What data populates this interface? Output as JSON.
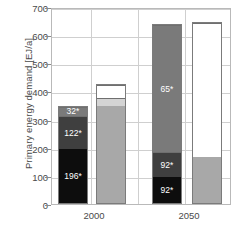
{
  "chart_data": {
    "type": "bar",
    "title": "",
    "xlabel": "",
    "ylabel": "Primary energy demand [EJ/a]",
    "ylim": [
      0,
      700
    ],
    "ytick_values": [
      0,
      100,
      200,
      300,
      400,
      500,
      600,
      700
    ],
    "ytick_labels": [
      "0",
      "100",
      "200",
      "300",
      "400",
      "500",
      "600",
      "700"
    ],
    "categories": [
      "2000",
      "2050"
    ],
    "grid": true,
    "legend": "none",
    "note": "Stacked bars with segment value labels marked with an asterisk; each year group has a stacked bar and a comparison bar.",
    "groups": [
      {
        "category": "2000",
        "bars": [
          {
            "name": "stacked-bar-2000",
            "total": 350,
            "segments": [
              {
                "label": "196*",
                "value": 196,
                "color": "#0d0d0d",
                "label_visible": true
              },
              {
                "label": "122*",
                "value": 122,
                "color": "#3f3f3f",
                "label_visible": true
              },
              {
                "label": "32*",
                "value": 32,
                "color": "#7a7a7a",
                "label_visible": true
              }
            ]
          },
          {
            "name": "comparison-bar-2000",
            "total": 425,
            "segments": [
              {
                "label": "",
                "value": 350,
                "color": "#a8a8a8",
                "label_visible": false
              },
              {
                "label": "",
                "value": 30,
                "color": "#d4d4d4",
                "label_visible": false
              },
              {
                "label": "",
                "value": 45,
                "color": "#ffffff",
                "label_visible": false
              }
            ]
          }
        ]
      },
      {
        "category": "2050",
        "bars": [
          {
            "name": "stacked-bar-2050",
            "total": 640,
            "segments": [
              {
                "label": "92*",
                "value": 92,
                "color": "#0d0d0d",
                "label_visible": true
              },
              {
                "label": "92*",
                "value": 92,
                "color": "#3f3f3f",
                "label_visible": true
              },
              {
                "label": "65*",
                "value": 456,
                "color": "#7a7a7a",
                "label_visible": true
              }
            ]
          },
          {
            "name": "comparison-bar-2050",
            "total": 645,
            "segments": [
              {
                "label": "",
                "value": 165,
                "color": "#a8a8a8",
                "label_visible": false
              },
              {
                "label": "",
                "value": 480,
                "color": "#ffffff",
                "label_visible": false
              }
            ]
          }
        ]
      }
    ]
  }
}
